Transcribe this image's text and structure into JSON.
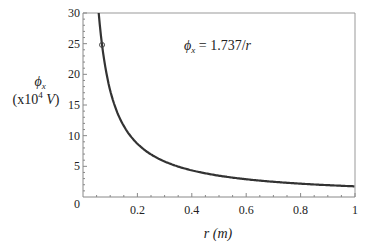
{
  "chart_data": {
    "type": "line",
    "title": "",
    "annotation": "ϕx = 1.737/r",
    "annotation_parts": {
      "symbol": "ϕ",
      "sub": "x",
      "rest": " = 1.737/",
      "var": "r"
    },
    "xlabel": "r (m)",
    "xlabel_parts": {
      "var": "r",
      "unit": "(m)"
    },
    "ylabel": "ϕx (x10^4 V)",
    "ylabel_parts": {
      "symbol": "ϕ",
      "sub": "x",
      "line2a": "(x10",
      "sup": "4",
      "unit": " V",
      "close": ")"
    },
    "xlim": [
      0,
      1
    ],
    "ylim": [
      0,
      30
    ],
    "x_ticks": [
      "0.2",
      "0.4",
      "0.6",
      "0.8",
      "1"
    ],
    "y_ticks": [
      "5",
      "10",
      "15",
      "20",
      "25",
      "30"
    ],
    "origin_label": "0",
    "grid": false,
    "series": [
      {
        "name": "ϕx = 1.737/r",
        "function": "1.737/r",
        "x": [
          0.058,
          0.07,
          0.1,
          0.2,
          0.3,
          0.4,
          0.5,
          0.6,
          0.7,
          0.8,
          0.9,
          1.0
        ],
        "values": [
          30,
          24.8,
          17.4,
          8.7,
          5.8,
          4.3,
          3.5,
          2.9,
          2.5,
          2.2,
          1.9,
          1.74
        ]
      }
    ],
    "marker_point": {
      "x": 0.07,
      "y": 24.8
    }
  }
}
